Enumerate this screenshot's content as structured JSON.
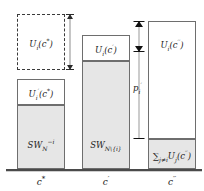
{
  "figure": {
    "caption_fragment": "",
    "baseline": "axis-baseline"
  },
  "columns": [
    {
      "id": "c-star",
      "axis_label_html": "c<sup>*</sup>",
      "axis_label_text": "c*",
      "segments": [
        {
          "name": "u-i-c-star-dashed",
          "style": "dashed",
          "label_html": "U<sub>i</sub>(c<sup>*</sup>)",
          "label_text": "U_i(c*)"
        },
        {
          "name": "u-i-prime-c-star",
          "style": "solid",
          "label_html": "U<sub>i</sub><sup>′</sup>(c<sup>*</sup>)",
          "label_text": "U'_i(c*)"
        },
        {
          "name": "sw-n-minus-i",
          "style": "filled",
          "label_html": "SW<sub>N</sub><sup>−i</sup>",
          "label_text": "SW_N^{-i}"
        }
      ]
    },
    {
      "id": "c-prime",
      "axis_label_html": "c<sup>′</sup>",
      "axis_label_text": "c'",
      "segments": [
        {
          "name": "u-i-c-prime",
          "style": "solid",
          "label_html": "U<sub>i</sub>(c<sup>′</sup>)",
          "label_text": "U_i(c')"
        },
        {
          "name": "sw-n-without-i",
          "style": "filled",
          "label_html": "SW<sub>N\\{i}</sub>",
          "label_text": "SW_{N\\{i}}"
        }
      ]
    },
    {
      "id": "c-double-prime",
      "axis_label_html": "c<sup>′′</sup>",
      "axis_label_text": "c''",
      "segments": [
        {
          "name": "u-i-c-double-prime",
          "style": "solid",
          "label_html": "U<sub>i</sub>(c<sup>′′</sup>)",
          "label_text": "U_i(c'')"
        },
        {
          "name": "sum-j-not-i-u-j",
          "style": "filled",
          "label_html": "∑<sub>j≠i</sub>U<sub>j</sub>(c<sup>′′</sup>)",
          "label_text": "sum_{j!=i} U_j(c'')"
        }
      ]
    }
  ],
  "arrows": [
    {
      "name": "gap-arrow-c-star",
      "label_html": "",
      "label_text": ""
    },
    {
      "name": "price-arrow-p-i-prime",
      "label_html": "p<sub>i</sub><sup>′</sup>",
      "label_text": "p'_i"
    }
  ]
}
